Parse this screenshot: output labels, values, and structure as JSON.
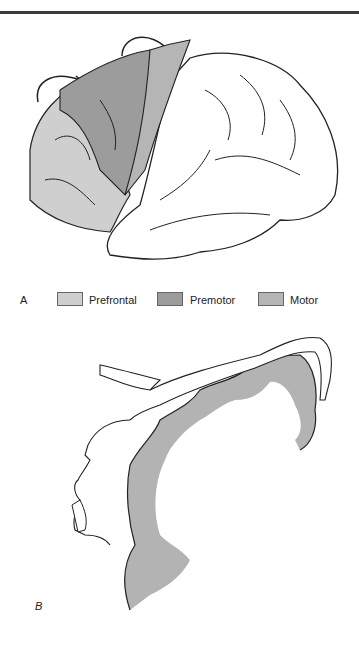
{
  "figure": {
    "panel_a": {
      "label": "A",
      "legend": [
        {
          "name": "Prefrontal",
          "color": "#cfcfcf"
        },
        {
          "name": "Premotor",
          "color": "#9c9c9c"
        },
        {
          "name": "Motor",
          "color": "#b5b5b5"
        }
      ]
    },
    "panel_b": {
      "label": "B"
    }
  }
}
